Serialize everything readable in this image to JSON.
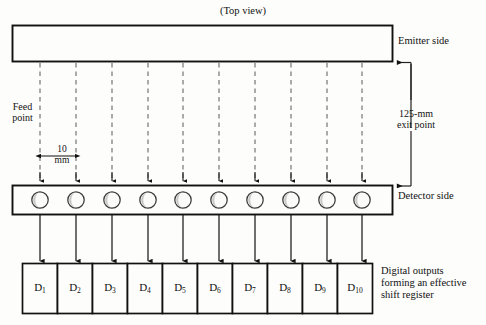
{
  "diagram": {
    "title": "(Top view)",
    "emitter": {
      "side_label": "Emitter side"
    },
    "detector": {
      "side_label": "Detector side",
      "count": 10
    },
    "annotations": {
      "feed_point": "Feed\npoint",
      "exit_point": "125-mm\nexit point",
      "spacing": "10\nmm",
      "outputs_caption": "Digital outputs\nforming an effective\nshift register"
    },
    "outputs": [
      {
        "label": "D",
        "index": "1"
      },
      {
        "label": "D",
        "index": "2"
      },
      {
        "label": "D",
        "index": "3"
      },
      {
        "label": "D",
        "index": "4"
      },
      {
        "label": "D",
        "index": "5"
      },
      {
        "label": "D",
        "index": "6"
      },
      {
        "label": "D",
        "index": "7"
      },
      {
        "label": "D",
        "index": "8"
      },
      {
        "label": "D",
        "index": "9"
      },
      {
        "label": "D",
        "index": "10"
      }
    ],
    "colors": {
      "background": "#fdfdfb",
      "stroke": "#111111",
      "dashed_beam": "#6f6f6f",
      "detector_fill": "#fbfbfa",
      "detector_shadow": "#c9c9c9",
      "leader": "#222222"
    }
  }
}
